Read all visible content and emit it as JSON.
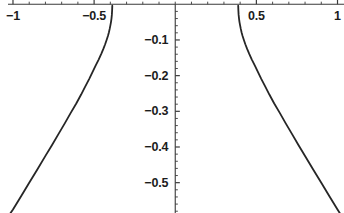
{
  "chart_data": {
    "type": "line",
    "title": "",
    "subtitle": "",
    "xlabel": "",
    "ylabel": "",
    "xlim": [
      -1.08,
      1.04
    ],
    "ylim": [
      -0.585,
      0.012
    ],
    "grid": false,
    "legend": null,
    "axis_position": {
      "x_axis_at_y": 0,
      "y_axis_at_x": 0
    },
    "x_ticks_major": [
      -1,
      -0.5,
      0.5,
      1
    ],
    "x_tick_labels": [
      "-1",
      "-0.5",
      "0.5",
      "1"
    ],
    "x_ticks_minor_step": 0.1,
    "y_ticks_major": [
      -0.1,
      -0.2,
      -0.3,
      -0.4,
      -0.5
    ],
    "y_tick_labels": [
      "-0.1",
      "-0.2",
      "-0.3",
      "-0.4",
      "-0.5"
    ],
    "y_ticks_minor_step": 0.02,
    "line_color": "#262626",
    "line_width": 1.8,
    "axis_color": "#3a3a3a",
    "background": "#ffffff",
    "asymptotes": [
      -0.38,
      0.38
    ],
    "series": [
      {
        "name": "branch-left",
        "x": [
          -1.06,
          -1.0,
          -0.95,
          -0.9,
          -0.85,
          -0.8,
          -0.76,
          -0.72,
          -0.68,
          -0.645,
          -0.61,
          -0.58,
          -0.555,
          -0.53,
          -0.51,
          -0.49,
          -0.472,
          -0.456,
          -0.443,
          -0.432,
          -0.423,
          -0.415,
          -0.409,
          -0.404,
          -0.4,
          -0.396,
          -0.393,
          -0.3905,
          -0.389,
          -0.388
        ],
        "y": [
          -0.615,
          -0.575,
          -0.538,
          -0.5,
          -0.463,
          -0.425,
          -0.395,
          -0.364,
          -0.333,
          -0.305,
          -0.278,
          -0.253,
          -0.231,
          -0.209,
          -0.19,
          -0.171,
          -0.155,
          -0.139,
          -0.125,
          -0.112,
          -0.1,
          -0.089,
          -0.079,
          -0.069,
          -0.06,
          -0.05,
          -0.04,
          -0.029,
          -0.017,
          -0.004
        ]
      },
      {
        "name": "branch-right",
        "x": [
          0.388,
          0.389,
          0.3905,
          0.393,
          0.396,
          0.4,
          0.404,
          0.409,
          0.415,
          0.423,
          0.432,
          0.443,
          0.456,
          0.472,
          0.49,
          0.51,
          0.53,
          0.555,
          0.58,
          0.61,
          0.645,
          0.68,
          0.72,
          0.76,
          0.8,
          0.85,
          0.9,
          0.95,
          1.0,
          1.045
        ],
        "y": [
          -0.004,
          -0.017,
          -0.029,
          -0.04,
          -0.05,
          -0.06,
          -0.069,
          -0.079,
          -0.089,
          -0.1,
          -0.112,
          -0.125,
          -0.139,
          -0.155,
          -0.171,
          -0.19,
          -0.209,
          -0.231,
          -0.253,
          -0.278,
          -0.305,
          -0.333,
          -0.364,
          -0.395,
          -0.425,
          -0.463,
          -0.5,
          -0.538,
          -0.575,
          -0.608
        ]
      }
    ]
  }
}
